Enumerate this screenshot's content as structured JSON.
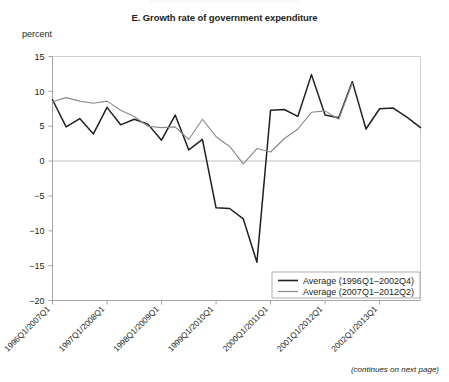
{
  "figure": {
    "title": "E. Growth rate of government expenditure",
    "unit_label": "percent",
    "footnote": "(continues on next page)"
  },
  "chart_data": {
    "type": "line",
    "title": "E. Growth rate of government expenditure",
    "xlabel": "",
    "ylabel": "percent",
    "ylim": [
      -20,
      15
    ],
    "yticks": [
      15,
      10,
      5,
      0,
      -5,
      -10,
      -15,
      -20
    ],
    "ytick_labels": [
      "15",
      "10",
      "5",
      "0",
      "−5",
      "−10",
      "−15",
      "−20"
    ],
    "grid": false,
    "zero_line": true,
    "xtick_labels": [
      "1996Q1/2007Q1",
      "1997Q1/2008Q1",
      "1998Q1/2009Q1",
      "1999Q1/2010Q1",
      "2000Q1/2011Q1",
      "2001Q1/2012Q1",
      "2002Q1/2013Q1"
    ],
    "x_quarter_index": [
      0,
      1,
      2,
      3,
      4,
      5,
      6,
      7,
      8,
      9,
      10,
      11,
      12,
      13,
      14,
      15,
      16,
      17,
      18,
      19,
      20,
      21,
      22,
      23,
      24,
      25,
      26,
      27
    ],
    "legend_position": "bottom-right",
    "series": [
      {
        "name": "Average (1996Q1–2002Q4)",
        "color": "#231f20",
        "values": [
          8.8,
          4.9,
          6.1,
          3.9,
          7.7,
          5.2,
          6.0,
          5.3,
          3.0,
          6.6,
          1.6,
          3.1,
          -6.7,
          -6.8,
          -8.3,
          -14.5,
          7.3,
          7.4,
          6.4,
          12.4,
          6.6,
          6.2,
          11.4,
          4.6,
          7.5,
          7.6,
          6.3,
          4.8
        ]
      },
      {
        "name": "Average (2007Q1–2012Q2)",
        "color": "#8a8a8a",
        "values": [
          8.5,
          9.1,
          8.6,
          8.3,
          8.6,
          7.3,
          6.4,
          5.0,
          4.8,
          4.9,
          3.1,
          6.0,
          3.5,
          2.1,
          -0.4,
          1.8,
          1.3,
          3.2,
          4.6,
          7.0,
          7.2,
          6.0,
          11.2
        ]
      }
    ]
  },
  "legend": {
    "items": [
      {
        "label": "Average (1996Q1–2002Q4)",
        "color": "#231f20"
      },
      {
        "label": "Average (2007Q1–2012Q2)",
        "color": "#8a8a8a"
      }
    ]
  }
}
